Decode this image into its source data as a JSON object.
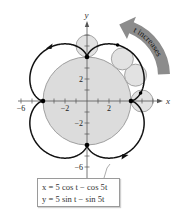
{
  "diagram": {
    "type": "epicycloid",
    "x_axis_label": "x",
    "y_axis_label": "y",
    "x_tick_labels": [
      "−6",
      "−2",
      "2"
    ],
    "x_tick_values": [
      -6,
      -2,
      2
    ],
    "y_tick_labels": [
      "2",
      "−2",
      "−6"
    ],
    "y_tick_values": [
      2,
      -2,
      -6
    ],
    "fixed_circle_radius": 4,
    "rolling_circle_radius": 1,
    "rolling_circle_angles_deg": [
      0,
      28,
      50,
      90
    ],
    "cusp_points": [
      [
        4,
        0
      ],
      [
        0,
        4
      ],
      [
        -4,
        0
      ],
      [
        0,
        -4
      ]
    ],
    "extra_points_t_deg": [
      55,
      20
    ],
    "direction_arrow_label": "t increases",
    "equations": {
      "x": "x = 5 cos t − cos 5t",
      "y": "y = 5 sin t − sin 5t"
    },
    "colors": {
      "curve": "#111111",
      "fixed_circle_fill": "#dcdcdc",
      "fixed_circle_stroke": "#a0a0a0",
      "rolling_circle_fill": "#e2e2e2",
      "rolling_circle_stroke": "#9c9c9c",
      "arrow": "#8c8c8c"
    }
  }
}
